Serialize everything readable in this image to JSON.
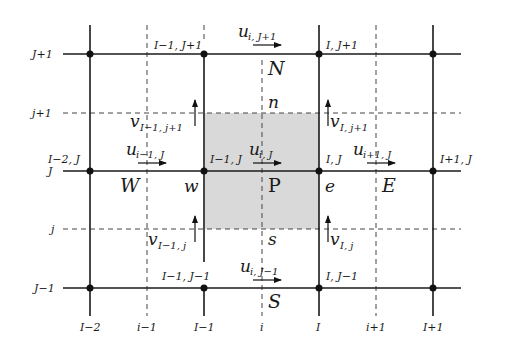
{
  "diagram": {
    "colors": {
      "control_volume_fill": "#d9d9d9",
      "line": "#1a1a1a"
    },
    "row_labels": {
      "J_plus_1": "J+1",
      "j_plus_1": "j+1",
      "J": "J",
      "j": "j",
      "J_minus_1": "J−1"
    },
    "column_labels": {
      "I_minus_2": "I−2",
      "i_minus_1": "i−1",
      "I_minus_1": "I−1",
      "i": "i",
      "I": "I",
      "i_plus_1": "i+1",
      "I_plus_1": "I+1"
    },
    "node_labels": {
      "I_minus_1_J_plus_1": "I−1, J+1",
      "I_J_plus_1": "I, J+1",
      "I_minus_2_J": "I−2, J",
      "I_minus_1_J": "I−1, J",
      "I_J": "I, J",
      "I_plus_1_J": "I+1, J",
      "I_minus_1_J_minus_1": "I−1, J−1",
      "I_J_minus_1": "I, J−1"
    },
    "compass_labels": {
      "N": "N",
      "n": "n",
      "W": "W",
      "w": "w",
      "P": "P",
      "e": "e",
      "E": "E",
      "s": "s",
      "S": "S"
    },
    "velocities": {
      "u_i_Jp1": {
        "base": "u",
        "sub": "i, J+1"
      },
      "u_im1_J": {
        "base": "u",
        "sub": "i−1, J"
      },
      "u_i_J": {
        "base": "u",
        "sub": "i, J"
      },
      "u_ip1_J": {
        "base": "u",
        "sub": "i+1, J"
      },
      "u_i_Jm1": {
        "base": "u",
        "sub": "i, J−1"
      },
      "v_Im1_jp1": {
        "base": "v",
        "sub": "I−1, j+1"
      },
      "v_I_jp1": {
        "base": "v",
        "sub": "I, j+1"
      },
      "v_Im1_j": {
        "base": "v",
        "sub": "I−1, j"
      },
      "v_I_j": {
        "base": "v",
        "sub": "I, j"
      }
    }
  }
}
